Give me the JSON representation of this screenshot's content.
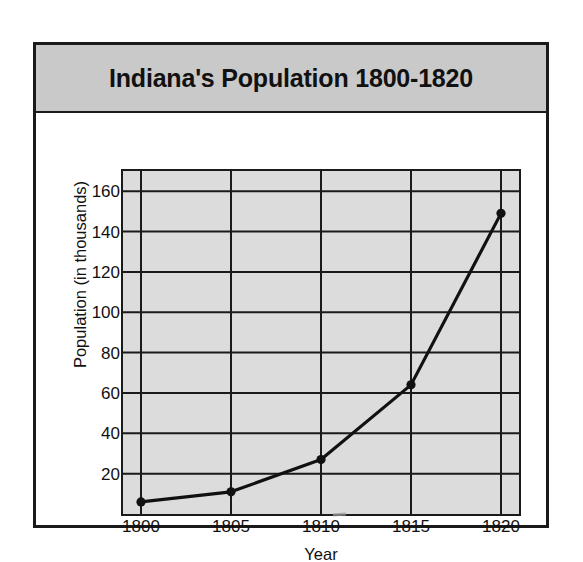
{
  "figure": {
    "title": "Indiana's Population 1800-1820",
    "banner_color": "#c9c9c9",
    "border_color": "#1a1a1a",
    "plot_background": "#dcdcdc"
  },
  "chart_data": {
    "type": "line",
    "title": "Indiana's Population 1800-1820",
    "xlabel": "Year",
    "ylabel": "Population (in thousands)",
    "x": [
      1800,
      1805,
      1810,
      1815,
      1820
    ],
    "values": [
      6,
      11,
      27,
      64,
      149
    ],
    "categories": [
      "1800",
      "1805",
      "1810",
      "1815",
      "1820"
    ],
    "xlim": [
      1799,
      1821
    ],
    "ylim": [
      0,
      170
    ],
    "xticks": [
      1800,
      1805,
      1810,
      1815,
      1820
    ],
    "xtick_labels": [
      "1800",
      "1805",
      "1810",
      "1815",
      "1820"
    ],
    "yticks": [
      20,
      40,
      60,
      80,
      100,
      120,
      140,
      160
    ],
    "ytick_labels": [
      "20",
      "40",
      "60",
      "80",
      "100",
      "120",
      "140",
      "160"
    ],
    "grid": true,
    "legend": false,
    "marker": "filled-circle",
    "line_color": "#111111",
    "series": [
      {
        "name": "Population",
        "points": [
          {
            "x": 1800,
            "y": 6
          },
          {
            "x": 1805,
            "y": 11
          },
          {
            "x": 1810,
            "y": 27
          },
          {
            "x": 1815,
            "y": 64
          },
          {
            "x": 1820,
            "y": 149
          }
        ]
      }
    ]
  }
}
